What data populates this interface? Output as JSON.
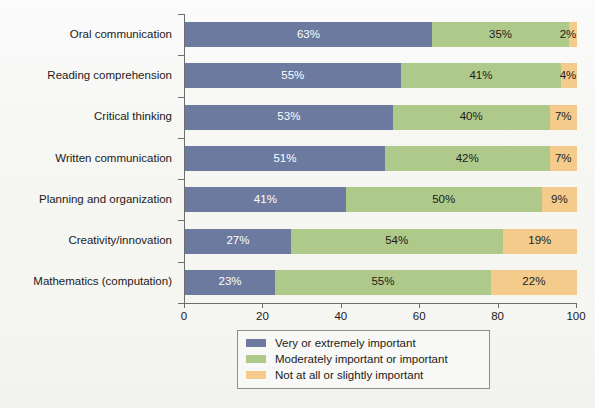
{
  "figure": {
    "background_color": "#f7f7f5",
    "axis_color": "#6d6d6d"
  },
  "chart_data": {
    "type": "bar",
    "orientation": "horizontal",
    "stacked": true,
    "stack_mode": "percent",
    "title": "",
    "subtitle": "",
    "xlabel": "",
    "ylabel": "",
    "xlim": [
      0,
      100
    ],
    "xticks": [
      0,
      20,
      40,
      60,
      80,
      100
    ],
    "xtick_labels": [
      "0",
      "20",
      "40",
      "60",
      "80",
      "100"
    ],
    "grid": false,
    "legend_position": "bottom-center",
    "value_suffix": "%",
    "categories": [
      "Oral communication",
      "Reading comprehension",
      "Critical thinking",
      "Written communication",
      "Planning and organization",
      "Creativity/innovation",
      "Mathematics (computation)"
    ],
    "series": [
      {
        "name": "Very or extremely important",
        "color": "#6b7a9e",
        "label_color": "#ffffff",
        "values": [
          63,
          55,
          53,
          51,
          41,
          27,
          23
        ],
        "labels": [
          "63%",
          "55%",
          "53%",
          "51%",
          "41%",
          "27%",
          "23%"
        ]
      },
      {
        "name": "Moderately important or important",
        "color": "#afc98b",
        "label_color": "#1b1b1b",
        "values": [
          35,
          41,
          40,
          42,
          50,
          54,
          55
        ],
        "labels": [
          "35%",
          "41%",
          "40%",
          "42%",
          "50%",
          "54%",
          "55%"
        ]
      },
      {
        "name": "Not at all or slightly important",
        "color": "#f5cb8c",
        "label_color": "#1b1b1b",
        "values": [
          2,
          4,
          7,
          7,
          9,
          19,
          22
        ],
        "labels": [
          "2%",
          "4%",
          "7%",
          "7%",
          "9%",
          "19%",
          "22%"
        ]
      }
    ]
  },
  "legend": {
    "items": [
      {
        "label": "Very or extremely important",
        "color": "#6b7a9e"
      },
      {
        "label": "Moderately important or important",
        "color": "#afc98b"
      },
      {
        "label": "Not at all or slightly important",
        "color": "#f5cb8c"
      }
    ]
  }
}
